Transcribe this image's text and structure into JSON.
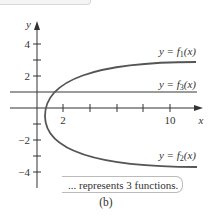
{
  "figure": {
    "caption": "(b)",
    "callout_text": "... represents 3 functions.",
    "colors": {
      "axis": "#333333",
      "curve": "#555555",
      "horizontal_line": "#7a7a7a",
      "callout_border": "#bbbbbb"
    }
  },
  "axes": {
    "x_label": "x",
    "y_label": "y",
    "x_ticks": [
      {
        "value": 2,
        "label": "2"
      },
      {
        "value": 4,
        "label": ""
      },
      {
        "value": 6,
        "label": ""
      },
      {
        "value": 8,
        "label": ""
      },
      {
        "value": 10,
        "label": "10"
      }
    ],
    "y_ticks": [
      {
        "value": 4,
        "label": "4"
      },
      {
        "value": 3,
        "label": ""
      },
      {
        "value": 2,
        "label": "2"
      },
      {
        "value": 1,
        "label": ""
      },
      {
        "value": -1,
        "label": ""
      },
      {
        "value": -2,
        "label": "−2"
      },
      {
        "value": -3,
        "label": ""
      },
      {
        "value": -4,
        "label": "−4"
      }
    ]
  },
  "curves": {
    "f1_label_prefix": "y = f",
    "f1_sub": "1",
    "f2_label_prefix": "y = f",
    "f2_sub": "2",
    "f3_label_prefix": "y = f",
    "f3_sub": "3",
    "arg": "(x)"
  }
}
